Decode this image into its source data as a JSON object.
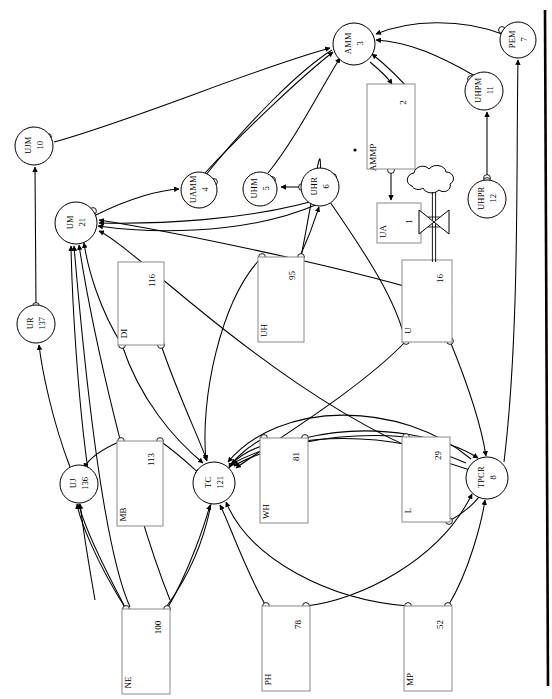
{
  "diagram": {
    "kind": "node-link diagram with circular places, rectangular transitions, arc arrows, port circles, a cloud source and a bowtie valve",
    "page_border": "thick vertical rule on right edge",
    "background_color": "#ffffff",
    "stroke_color": "#000000",
    "box_stroke_color": "#888888"
  },
  "circles": [
    {
      "id": "amm",
      "name": "AMM",
      "num": "3",
      "cx": 354,
      "cy": 44,
      "r": 21
    },
    {
      "id": "pem",
      "name": "PEM",
      "num": "7",
      "cx": 518,
      "cy": 40,
      "r": 18
    },
    {
      "id": "uhpm",
      "name": "UHPM",
      "num": "11",
      "cx": 484,
      "cy": 91,
      "r": 19
    },
    {
      "id": "ujm",
      "name": "UJM",
      "num": "10",
      "cx": 34,
      "cy": 146,
      "r": 19
    },
    {
      "id": "uamm",
      "name": "UAMM",
      "num": "4",
      "cx": 199,
      "cy": 190,
      "r": 18
    },
    {
      "id": "uhm",
      "name": "UHM",
      "num": "5",
      "cx": 260,
      "cy": 189,
      "r": 17
    },
    {
      "id": "uhr",
      "name": "UHR",
      "num": "6",
      "cx": 320,
      "cy": 187,
      "r": 19
    },
    {
      "id": "uhpr",
      "name": "UHPR",
      "num": "12",
      "cx": 487,
      "cy": 199,
      "r": 19
    },
    {
      "id": "um",
      "name": "UM",
      "num": "21",
      "cx": 76,
      "cy": 223,
      "r": 21
    },
    {
      "id": "ur",
      "name": "UR",
      "num": "137",
      "cx": 36,
      "cy": 324,
      "r": 19
    },
    {
      "id": "uj",
      "name": "UJ",
      "num": "136",
      "cx": 79,
      "cy": 484,
      "r": 19
    },
    {
      "id": "tc",
      "name": "TC",
      "num": "121",
      "cx": 214,
      "cy": 483,
      "r": 21
    },
    {
      "id": "tpcr",
      "name": "TPCR",
      "num": "8",
      "cx": 487,
      "cy": 478,
      "r": 21
    }
  ],
  "boxes": [
    {
      "id": "ammp",
      "name": "AMMP",
      "num": "2",
      "x": 367,
      "y": 84,
      "w": 48,
      "h": 85
    },
    {
      "id": "ua",
      "name": "UA",
      "num": "1",
      "x": 377,
      "y": 203,
      "w": 44,
      "h": 40
    },
    {
      "id": "di",
      "name": "DI",
      "num": "116",
      "x": 118,
      "y": 262,
      "w": 46,
      "h": 83
    },
    {
      "id": "uh",
      "name": "UH",
      "num": "95",
      "x": 258,
      "y": 257,
      "w": 46,
      "h": 85
    },
    {
      "id": "u",
      "name": "U",
      "num": "16",
      "x": 402,
      "y": 260,
      "w": 50,
      "h": 82
    },
    {
      "id": "mb",
      "name": "MB",
      "num": "113",
      "x": 117,
      "y": 441,
      "w": 46,
      "h": 85
    },
    {
      "id": "wh",
      "name": "WH",
      "num": "81",
      "x": 260,
      "y": 438,
      "w": 48,
      "h": 85
    },
    {
      "id": "l",
      "name": "L",
      "num": "29",
      "x": 402,
      "y": 437,
      "w": 48,
      "h": 85
    },
    {
      "id": "ne",
      "name": "NE",
      "num": "100",
      "x": 122,
      "y": 609,
      "w": 48,
      "h": 85
    },
    {
      "id": "ph",
      "name": "PH",
      "num": "78",
      "x": 262,
      "y": 606,
      "w": 48,
      "h": 85
    },
    {
      "id": "mp",
      "name": "MP",
      "num": "52",
      "x": 404,
      "y": 606,
      "w": 48,
      "h": 85
    }
  ],
  "symbols": {
    "cloud_source": {
      "label": "cloud-source",
      "cx": 434,
      "cy": 182
    },
    "valve": {
      "label": "bowtie-valve",
      "cx": 434,
      "cy": 222
    },
    "dot_marker": {
      "label": "token-dot",
      "cx": 355,
      "cy": 150
    }
  },
  "edge_count": 58,
  "port_circles": 26
}
